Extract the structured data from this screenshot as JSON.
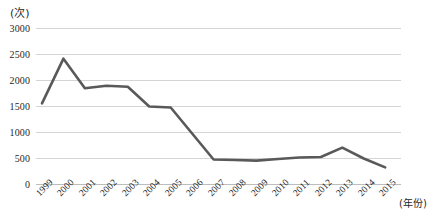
{
  "chart_data": {
    "type": "line",
    "title": "",
    "xlabel": "(年份)",
    "ylabel": "(次)",
    "ylim": [
      0,
      3000
    ],
    "yticks": [
      0,
      500,
      1000,
      1500,
      2000,
      2500,
      3000
    ],
    "ytick_labels": [
      "0",
      "500",
      "1000",
      "1500",
      "2000",
      "2500",
      "3000"
    ],
    "grid": true,
    "legend": "none",
    "line_color": "#595959",
    "grid_color": "#d4d4d4",
    "categories": [
      "1999",
      "2000",
      "2001",
      "2002",
      "2003",
      "2004",
      "2005",
      "2006",
      "2007",
      "2008",
      "2009",
      "2010",
      "2011",
      "2012",
      "2013",
      "2014",
      "2015"
    ],
    "values": [
      1560,
      2420,
      1850,
      1900,
      1880,
      1500,
      1480,
      980,
      480,
      470,
      460,
      490,
      520,
      530,
      710,
      500,
      330
    ]
  }
}
